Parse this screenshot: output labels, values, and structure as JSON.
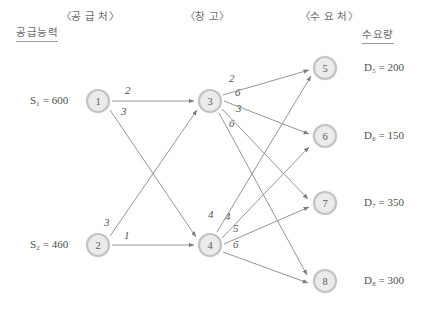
{
  "diagram": {
    "title_columns": {
      "supply_source": "〈공 급 처〉",
      "warehouse": "〈창   고〉",
      "demand_point": "〈수 요 처〉"
    },
    "column_headers": {
      "supply_capacity": "공급능력",
      "demand_quantity": "수요량"
    },
    "supply_nodes": [
      {
        "id": "1",
        "label": "1",
        "capacity_text": "600",
        "capacity_label": "S",
        "sub": "1",
        "x": 98,
        "y": 101
      },
      {
        "id": "2",
        "label": "2",
        "capacity_text": "460",
        "capacity_label": "S",
        "sub": "2",
        "x": 98,
        "y": 245
      }
    ],
    "warehouse_nodes": [
      {
        "id": "3",
        "label": "3",
        "x": 210,
        "y": 101
      },
      {
        "id": "4",
        "label": "4",
        "x": 210,
        "y": 245
      }
    ],
    "demand_nodes": [
      {
        "id": "5",
        "label": "5",
        "demand_label": "D",
        "sub": "5",
        "demand_text": "200",
        "x": 325,
        "y": 68
      },
      {
        "id": "6",
        "label": "6",
        "demand_label": "D",
        "sub": "6",
        "demand_text": "150",
        "x": 325,
        "y": 136
      },
      {
        "id": "7",
        "label": "7",
        "demand_label": "D",
        "sub": "7",
        "demand_text": "350",
        "x": 325,
        "y": 203
      },
      {
        "id": "8",
        "label": "8",
        "demand_label": "D",
        "sub": "8",
        "demand_text": "300",
        "x": 325,
        "y": 281
      }
    ],
    "supply_values": {
      "S1": "S₁ = 600",
      "S2": "S₂ = 460"
    },
    "demand_values": {
      "D5": "D₅ = 200",
      "D6": "D₆ = 150",
      "D7": "D₇ = 350",
      "D8": "D₈ = 300"
    },
    "edges": [
      {
        "from": "1",
        "to": "3",
        "cost": "2",
        "lx": 125,
        "ly": 93
      },
      {
        "from": "1",
        "to": "4",
        "cost": "3",
        "lx": 122,
        "ly": 114
      },
      {
        "from": "2",
        "to": "3",
        "cost": "3",
        "lx": 108,
        "ly": 226
      },
      {
        "from": "2",
        "to": "4",
        "cost": "1",
        "lx": 124,
        "ly": 238
      },
      {
        "from": "3",
        "to": "5",
        "cost": "2",
        "lx": 231,
        "ly": 81
      },
      {
        "from": "3",
        "to": "6",
        "cost": "6",
        "lx": 237,
        "ly": 95
      },
      {
        "from": "3",
        "to": "7",
        "cost": "3",
        "lx": 238,
        "ly": 111
      },
      {
        "from": "3",
        "to": "8",
        "cost": "6",
        "lx": 231,
        "ly": 126
      },
      {
        "from": "4",
        "to": "5",
        "cost": "4",
        "lx": 211,
        "ly": 218
      },
      {
        "from": "4",
        "to": "6",
        "cost": "4",
        "lx": 228,
        "ly": 220
      },
      {
        "from": "4",
        "to": "7",
        "cost": "5",
        "lx": 236,
        "ly": 232
      },
      {
        "from": "4",
        "to": "8",
        "cost": "6",
        "lx": 236,
        "ly": 247
      }
    ]
  },
  "colors": {
    "node_fill": "#ebebeb",
    "node_ring": "#c4c4c4",
    "edge": "#8a8a8a",
    "text": "#4f4f4f",
    "header_text": "#6b6b6b",
    "background": "#ffffff"
  }
}
